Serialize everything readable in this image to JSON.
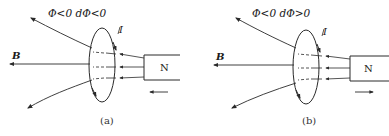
{
  "figure": {
    "panels": [
      {
        "id": "a",
        "condition": "Φ<0  dΦ<0",
        "flux_sign": "Φ<0",
        "flux_change": "dΦ<0",
        "field_label": "B",
        "current_label": "I",
        "magnet_label": "N",
        "magnet_motion": "left",
        "caption": "(a)"
      },
      {
        "id": "b",
        "condition": "Φ<0  dΦ>0",
        "flux_sign": "Φ<0",
        "flux_change": "dΦ>0",
        "field_label": "B",
        "current_label": "I",
        "magnet_label": "N",
        "magnet_motion": "right",
        "caption": "(b)"
      }
    ],
    "colors": {
      "line": "#2a2a2a",
      "background": "#ffffff"
    }
  }
}
